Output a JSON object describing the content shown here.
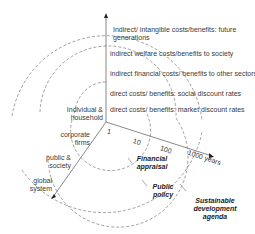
{
  "diagram": {
    "vertical_axis_labels": [
      "Indirect/ intangible costs/benefits: future generations",
      "indirect welfare costs/benefits to society",
      "indirect financial costs/ benefits to other sectors",
      "direct costs/ benefits:  social discount rates",
      "direct costs/ benefits:  market discount rates"
    ],
    "vertical_labels": {
      "l1a": "Indirect/ intangible costs/benefits: future",
      "l1b": "generations",
      "l2": "indirect welfare costs/benefits to society",
      "l3": "indirect financial costs/ benefits to other sectors",
      "l4": "direct costs/ benefits:  social discount rates",
      "l5": "direct costs/ benefits:  market discount rates"
    },
    "actor_axis_labels": {
      "a1a": "Individual &",
      "a1b": "household",
      "a2a": "corporate",
      "a2b": "firms",
      "a3a": "public &",
      "a3b": "society",
      "a4a": "global",
      "a4b": "system"
    },
    "time_axis_labels": {
      "t1": "1",
      "t2": "10",
      "t3": "100",
      "t4": "1000 years"
    },
    "domains": {
      "d1a": "Financial",
      "d1b": "appraisal",
      "d2a": "Public",
      "d2b": "policy",
      "d3a": "Sustainable",
      "d3b": "development",
      "d3c": "agenda"
    },
    "colors": {
      "line": "#555555",
      "arc": "#777777"
    }
  }
}
